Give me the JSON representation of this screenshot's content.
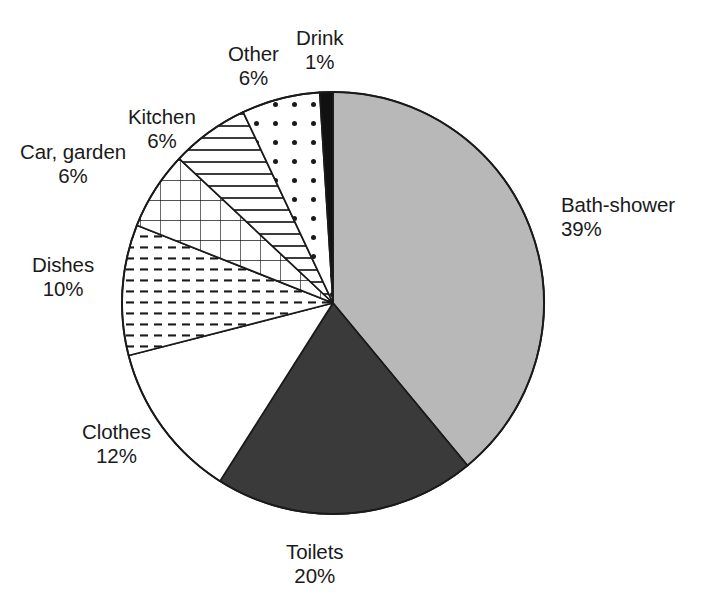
{
  "chart_data": {
    "type": "pie",
    "title": "",
    "subtitle": "",
    "xlabel": "",
    "ylabel": "",
    "legend_position": "none",
    "grid": false,
    "unit": "%",
    "start_angle_deg": 0,
    "direction": "clockwise",
    "categories": [
      "Bath-shower",
      "Toilets",
      "Clothes",
      "Dishes",
      "Car, garden",
      "Kitchen",
      "Other",
      "Drink"
    ],
    "values": [
      39,
      20,
      12,
      10,
      6,
      6,
      6,
      1
    ],
    "slices": [
      {
        "name": "Bath-shower",
        "value": 39,
        "percent_label": "39%",
        "fill_style": "solid-light-gray",
        "fill_color": "#b8b8b8",
        "stroke_color": "#1a1a1a"
      },
      {
        "name": "Toilets",
        "value": 20,
        "percent_label": "20%",
        "fill_style": "solid-dark-gray",
        "fill_color": "#3a3a3a",
        "stroke_color": "#1a1a1a"
      },
      {
        "name": "Clothes",
        "value": 12,
        "percent_label": "12%",
        "fill_style": "solid-white",
        "fill_color": "#ffffff",
        "stroke_color": "#1a1a1a"
      },
      {
        "name": "Dishes",
        "value": 10,
        "percent_label": "10%",
        "fill_style": "dashed-horizontal-lines",
        "fill_color": "#ffffff",
        "stroke_color": "#1a1a1a"
      },
      {
        "name": "Car, garden",
        "value": 6,
        "percent_label": "6%",
        "fill_style": "crosshatch-grid",
        "fill_color": "#ffffff",
        "stroke_color": "#1a1a1a"
      },
      {
        "name": "Kitchen",
        "value": 6,
        "percent_label": "6%",
        "fill_style": "horizontal-lines",
        "fill_color": "#ffffff",
        "stroke_color": "#1a1a1a"
      },
      {
        "name": "Other",
        "value": 6,
        "percent_label": "6%",
        "fill_style": "dots",
        "fill_color": "#ffffff",
        "stroke_color": "#1a1a1a"
      },
      {
        "name": "Drink",
        "value": 1,
        "percent_label": "1%",
        "fill_style": "solid-black",
        "fill_color": "#111111",
        "stroke_color": "#1a1a1a"
      }
    ]
  },
  "labels": {
    "bath_shower": {
      "name": "Bath-shower",
      "percent": "39%"
    },
    "toilets": {
      "name": "Toilets",
      "percent": "20%"
    },
    "clothes": {
      "name": "Clothes",
      "percent": "12%"
    },
    "dishes": {
      "name": "Dishes",
      "percent": "10%"
    },
    "car_garden": {
      "name": "Car, garden",
      "percent": "6%"
    },
    "kitchen": {
      "name": "Kitchen",
      "percent": "6%"
    },
    "other": {
      "name": "Other",
      "percent": "6%"
    },
    "drink": {
      "name": "Drink",
      "percent": "1%"
    }
  },
  "geometry": {
    "center_x": 333,
    "center_y": 303,
    "radius": 211
  }
}
